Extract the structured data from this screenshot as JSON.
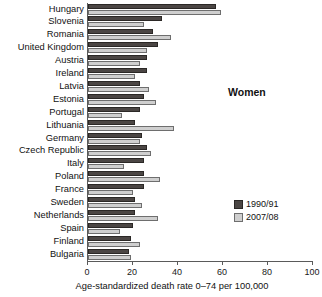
{
  "chart_data": {
    "type": "bar",
    "orientation": "horizontal",
    "title": "",
    "annotation": "Women",
    "xlabel": "Age-standardized death rate 0–74 per 100,000",
    "ylabel": "",
    "xlim": [
      0,
      100
    ],
    "xticks": [
      0,
      20,
      40,
      60,
      80,
      100
    ],
    "grid": false,
    "legend_position": "right-lower",
    "categories": [
      "Hungary",
      "Slovenia",
      "Romania",
      "United Kingdom",
      "Austria",
      "Ireland",
      "Latvia",
      "Estonia",
      "Portugal",
      "Lithuania",
      "Germany",
      "Czech Republic",
      "Italy",
      "Poland",
      "France",
      "Sweden",
      "Netherlands",
      "Spain",
      "Finland",
      "Bulgaria"
    ],
    "series": [
      {
        "name": "1990/91",
        "color": "#4b4644",
        "values": [
          57,
          33,
          29,
          31,
          26,
          26,
          23,
          25,
          23,
          21,
          24,
          26,
          25,
          25,
          25,
          21,
          21,
          20,
          19,
          18
        ]
      },
      {
        "name": "2007/08",
        "color": "#cfcfcf",
        "values": [
          59,
          25,
          37,
          26,
          23,
          21,
          27,
          30,
          15,
          38,
          23,
          28,
          16,
          32,
          20,
          24,
          31,
          14,
          23,
          19
        ]
      }
    ]
  },
  "legend": {
    "entries": [
      {
        "label": "1990/91",
        "swatch": "dark"
      },
      {
        "label": "2007/08",
        "swatch": "light"
      }
    ]
  },
  "axis": {
    "tick_labels": [
      "0",
      "20",
      "40",
      "60",
      "80",
      "100"
    ]
  }
}
